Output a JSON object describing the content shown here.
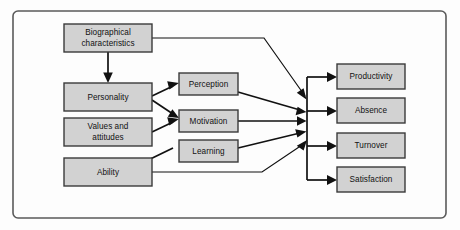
{
  "diagram": {
    "type": "flow-diagram",
    "frame": {
      "color": "#5a5a5a"
    },
    "palette": {
      "box_fill": "#d2d2d2",
      "box_border": "#3a3a3a",
      "arrow": "#111111",
      "background": "#fdfdfd"
    },
    "inputs": [
      {
        "id": "biographical",
        "label_line1": "Biographical",
        "label_line2": "characteristics"
      },
      {
        "id": "personality",
        "label_line1": "Personality",
        "label_line2": ""
      },
      {
        "id": "values",
        "label_line1": "Values and",
        "label_line2": "attitudes"
      },
      {
        "id": "ability",
        "label_line1": "Ability",
        "label_line2": ""
      }
    ],
    "processes": [
      {
        "id": "perception",
        "label_line1": "Perception",
        "label_line2": ""
      },
      {
        "id": "motivation",
        "label_line1": "Motivation",
        "label_line2": ""
      },
      {
        "id": "learning",
        "label_line1": "Learning",
        "label_line2": ""
      }
    ],
    "outcomes": [
      {
        "id": "productivity",
        "label_line1": "Productivity",
        "label_line2": ""
      },
      {
        "id": "absence",
        "label_line1": "Absence",
        "label_line2": ""
      },
      {
        "id": "turnover",
        "label_line1": "Turnover",
        "label_line2": ""
      },
      {
        "id": "satisfaction",
        "label_line1": "Satisfaction",
        "label_line2": ""
      }
    ],
    "connections": [
      {
        "from": "biographical",
        "to": "personality",
        "style": "vertical-arrow"
      },
      {
        "from": "biographical",
        "to": "outcome-bus",
        "style": "elbow-diagonal"
      },
      {
        "from": "personality",
        "to": "perception",
        "style": "diagonal-arrow"
      },
      {
        "from": "personality",
        "to": "motivation",
        "style": "diagonal-arrow"
      },
      {
        "from": "values",
        "to": "motivation",
        "style": "diagonal-arrow"
      },
      {
        "from": "learning",
        "to": "ability",
        "style": "diagonal-arrow"
      },
      {
        "from": "perception",
        "to": "outcome-bus",
        "style": "diagonal-arrow"
      },
      {
        "from": "motivation",
        "to": "outcome-bus",
        "style": "horizontal-arrow"
      },
      {
        "from": "learning",
        "to": "outcome-bus",
        "style": "diagonal-arrow"
      },
      {
        "from": "ability",
        "to": "outcome-bus",
        "style": "elbow-diagonal"
      },
      {
        "from": "outcome-bus",
        "to": "productivity",
        "style": "bus-branch"
      },
      {
        "from": "outcome-bus",
        "to": "absence",
        "style": "bus-branch"
      },
      {
        "from": "outcome-bus",
        "to": "turnover",
        "style": "bus-branch"
      },
      {
        "from": "outcome-bus",
        "to": "satisfaction",
        "style": "bus-branch"
      }
    ]
  }
}
